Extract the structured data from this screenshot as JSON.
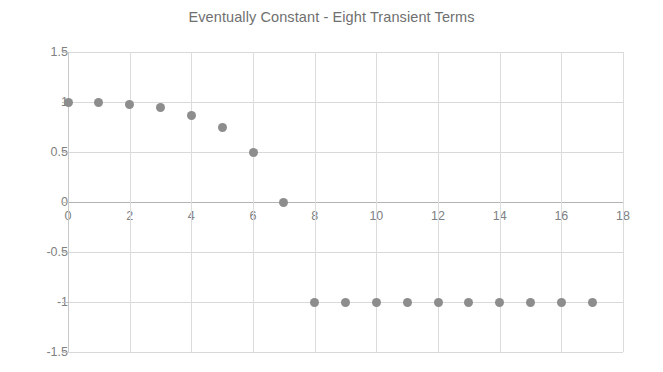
{
  "chart_data": {
    "type": "scatter",
    "title": "Eventually Constant - Eight Transient Terms",
    "xlabel": "",
    "ylabel": "",
    "xlim": [
      0,
      18
    ],
    "ylim": [
      -1.5,
      1.5
    ],
    "xticks": [
      0,
      2,
      4,
      6,
      8,
      10,
      12,
      14,
      16,
      18
    ],
    "xtick_labels": [
      "0",
      "2",
      "4",
      "6",
      "8",
      "10",
      "12",
      "14",
      "16",
      "18"
    ],
    "yticks": [
      1.5,
      1,
      0.5,
      0,
      -0.5,
      -1,
      -1.5
    ],
    "ytick_labels": [
      "1.5",
      "1",
      "0.5",
      "0",
      "-0.5",
      "-1",
      "-1.5"
    ],
    "grid": true,
    "legend": null,
    "marker_color": "#8d8d8d",
    "grid_color": "#d9d9d9",
    "text_color": "#808080",
    "title_color": "#6f6f6f",
    "background": "#ffffff",
    "series": [
      {
        "name": "sequence",
        "x": [
          0,
          1,
          2,
          3,
          4,
          5,
          6,
          7,
          8,
          9,
          10,
          11,
          12,
          13,
          14,
          15,
          16,
          17
        ],
        "y": [
          1,
          1,
          0.98,
          0.95,
          0.87,
          0.75,
          0.5,
          0,
          -1,
          -1,
          -1,
          -1,
          -1,
          -1,
          -1,
          -1,
          -1,
          -1
        ]
      }
    ]
  }
}
